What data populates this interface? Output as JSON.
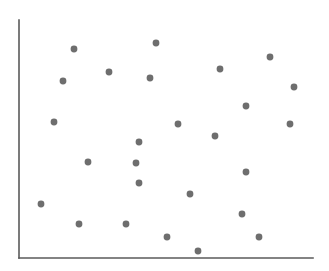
{
  "figure": {
    "width": 329,
    "height": 271,
    "background_color": "#ffffff",
    "title": "",
    "caption": ""
  },
  "axes": {
    "frame_style": "L-shaped spine (left and bottom only)",
    "spine_color": "#5a5a5a",
    "spine_width": 1.6,
    "left_spine": {
      "x": 19,
      "y_top": 20,
      "y_bottom": 258
    },
    "bottom_spine": {
      "y": 258,
      "x_left": 19,
      "x_right": 313
    },
    "ticks": "none",
    "tick_labels": "none",
    "gridlines": "none",
    "xlabel": "",
    "ylabel": ""
  },
  "marker": {
    "shape": "circle",
    "color": "#6e6e6e",
    "radius_px": 3.4,
    "edge": "none"
  },
  "chart_data": {
    "type": "scatter",
    "title": "",
    "xlabel": "",
    "ylabel": "",
    "grid": false,
    "legend": false,
    "legend_position": "none",
    "xlim": [
      19,
      313
    ],
    "ylim": [
      20,
      258
    ],
    "axis_units": "pixels (image coordinate space, y increases downward)",
    "n_points": 26,
    "series": [
      {
        "name": "points",
        "color": "#6e6e6e",
        "marker": "circle",
        "points": [
          {
            "x": 74,
            "y": 49
          },
          {
            "x": 156,
            "y": 43
          },
          {
            "x": 270,
            "y": 57
          },
          {
            "x": 109,
            "y": 72
          },
          {
            "x": 63,
            "y": 81
          },
          {
            "x": 220,
            "y": 69
          },
          {
            "x": 150,
            "y": 78
          },
          {
            "x": 294,
            "y": 87
          },
          {
            "x": 246,
            "y": 106
          },
          {
            "x": 54,
            "y": 122
          },
          {
            "x": 178,
            "y": 124
          },
          {
            "x": 290,
            "y": 124
          },
          {
            "x": 215,
            "y": 136
          },
          {
            "x": 139,
            "y": 142
          },
          {
            "x": 88,
            "y": 162
          },
          {
            "x": 136,
            "y": 163
          },
          {
            "x": 246,
            "y": 172
          },
          {
            "x": 139,
            "y": 183
          },
          {
            "x": 190,
            "y": 194
          },
          {
            "x": 41,
            "y": 204
          },
          {
            "x": 242,
            "y": 214
          },
          {
            "x": 79,
            "y": 224
          },
          {
            "x": 126,
            "y": 224
          },
          {
            "x": 167,
            "y": 237
          },
          {
            "x": 259,
            "y": 237
          },
          {
            "x": 198,
            "y": 251
          }
        ]
      }
    ]
  }
}
